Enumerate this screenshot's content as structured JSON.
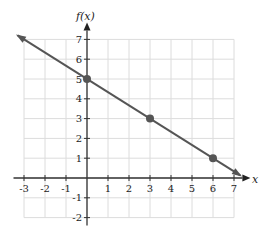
{
  "chart_data": {
    "type": "line",
    "title": "",
    "xlabel": "x",
    "ylabel": "f(x)",
    "xlim": [
      -3,
      7
    ],
    "ylim": [
      -2,
      7
    ],
    "grid": true,
    "x_ticks": [
      -3,
      -2,
      -1,
      1,
      2,
      3,
      4,
      5,
      6,
      7
    ],
    "y_ticks": [
      -2,
      -1,
      1,
      2,
      3,
      4,
      5,
      6,
      7
    ],
    "series": [
      {
        "name": "f(x)",
        "equation": "f(x) = 5 - (2/3)x",
        "line_endpoints": [
          [
            -3.3,
            7.2
          ],
          [
            7.3,
            0.133
          ]
        ],
        "points": [
          {
            "x": 0,
            "y": 5
          },
          {
            "x": 3,
            "y": 3
          },
          {
            "x": 6,
            "y": 1
          }
        ],
        "color": "#555555"
      }
    ]
  },
  "labels": {
    "x_axis": "x",
    "y_axis": "f(x)"
  }
}
